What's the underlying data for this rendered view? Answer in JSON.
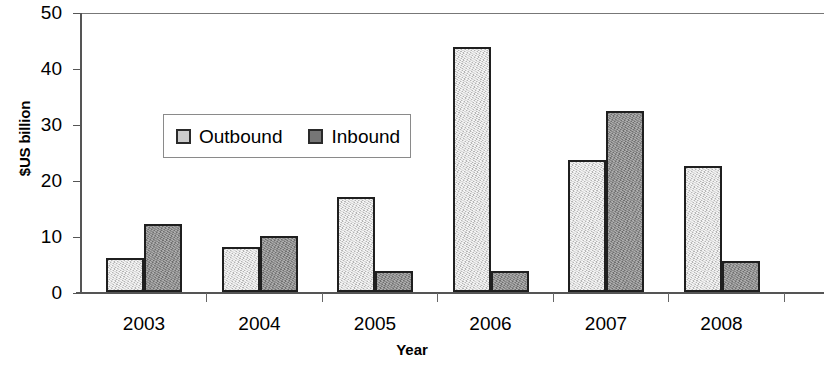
{
  "chart_data": {
    "type": "bar",
    "title": "",
    "xlabel": "Year",
    "ylabel": "$US billion",
    "categories": [
      "2003",
      "2004",
      "2005",
      "2006",
      "2007",
      "2008"
    ],
    "series": [
      {
        "name": "Outbound",
        "color": "#cbcbcb",
        "values": [
          6.0,
          8.0,
          17.0,
          43.7,
          23.5,
          22.5
        ]
      },
      {
        "name": "Inbound",
        "color": "#828282",
        "values": [
          12.2,
          10.0,
          3.8,
          3.8,
          32.4,
          5.5
        ]
      }
    ],
    "ylim": [
      0,
      50
    ],
    "yticks": [
      0,
      10,
      20,
      30,
      40,
      50
    ],
    "ytick_labels": [
      "0",
      "10",
      "20",
      "30",
      "40",
      "50"
    ],
    "grid": false,
    "legend_position": "upper-left-inside"
  },
  "axes": {
    "y_title": "$US billion",
    "x_title": "Year"
  },
  "legend": {
    "items": [
      {
        "label": "Outbound",
        "swatch": "outbound-swatch"
      },
      {
        "label": "Inbound",
        "swatch": "inbound-swatch"
      }
    ]
  }
}
